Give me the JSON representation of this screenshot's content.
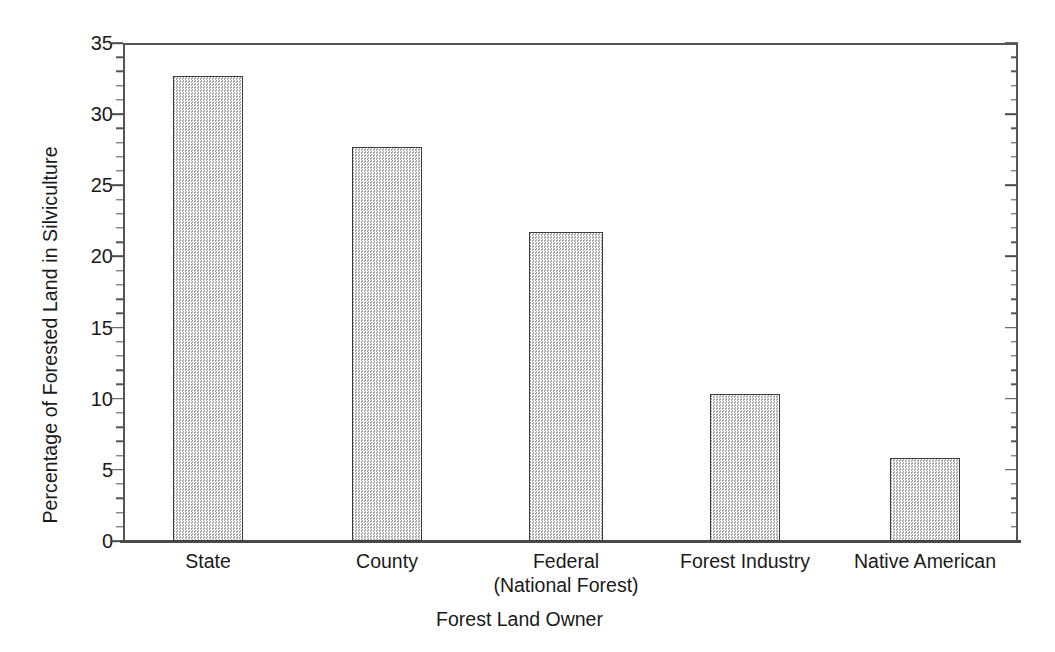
{
  "chart_data": {
    "type": "bar",
    "title": "",
    "subtitle": "",
    "xlabel": "Forest Land Owner",
    "ylabel": "Percentage of Forested Land in Silviculture",
    "categories": [
      "State",
      "County",
      "Federal\n(National Forest)",
      "Forest Industry",
      "Native American"
    ],
    "category_lines": [
      [
        "State"
      ],
      [
        "County"
      ],
      [
        "Federal",
        "(National Forest)"
      ],
      [
        "Forest Industry"
      ],
      [
        "Native American"
      ]
    ],
    "values": [
      32.7,
      27.7,
      21.7,
      10.3,
      5.8
    ],
    "ylim": [
      0,
      35
    ],
    "xlim": [
      0,
      5
    ],
    "y_major_ticks": [
      0,
      5,
      10,
      15,
      20,
      25,
      30,
      35
    ],
    "y_tick_labels": [
      "0",
      "5",
      "10",
      "15",
      "20",
      "25",
      "30",
      "35"
    ],
    "y_minor_tick_interval": 1,
    "grid": false,
    "legend": null,
    "legend_position": "none",
    "bar_fill": "#d9d9d9",
    "bar_edge": "#3d3d3d",
    "bar_pattern": "fine-checkerboard-stipple",
    "axis_color": "#555555",
    "background": "#ffffff",
    "bar_geometry": [
      {
        "left": 50,
        "width": 70,
        "value": 32.7
      },
      {
        "left": 229,
        "width": 70,
        "value": 27.7
      },
      {
        "left": 406,
        "width": 74,
        "value": 21.7
      },
      {
        "left": 587,
        "width": 70,
        "value": 10.3
      },
      {
        "left": 767,
        "width": 70,
        "value": 5.8
      }
    ],
    "category_centers": [
      85,
      264,
      443,
      622,
      802
    ]
  }
}
